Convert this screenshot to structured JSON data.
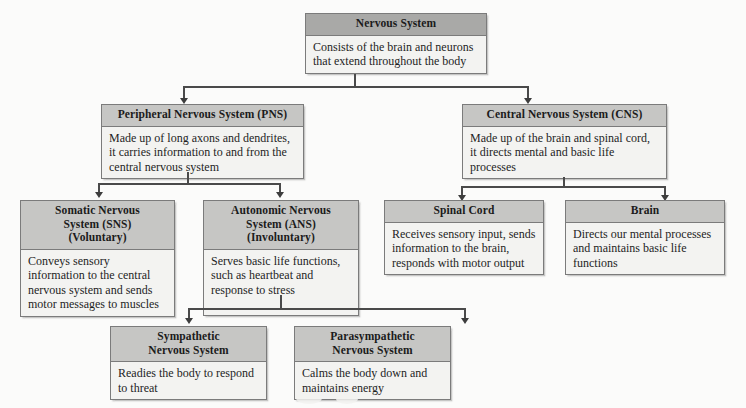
{
  "diagram": {
    "colors": {
      "root_header": "#a9a9a7",
      "node_header": "#c6c6c4",
      "node_body": "#f3f3f1",
      "border": "#7b7b7b",
      "connector": "#4a4a4a",
      "page_background": "#fbfbfa"
    },
    "nodes": [
      {
        "id": "nervous-system",
        "title": "Nervous System",
        "body": "Consists of the brain and neurons that extend throughout the body"
      },
      {
        "id": "peripheral-nervous-system",
        "title": "Peripheral Nervous System (PNS)",
        "body": "Made up of long axons and dendrites, it carries information to and from the central nervous system"
      },
      {
        "id": "central-nervous-system",
        "title": "Central Nervous System (CNS)",
        "body": "Made up of the brain and spinal cord, it directs mental and basic life processes"
      },
      {
        "id": "somatic-nervous-system",
        "title": "Somatic Nervous System (SNS) (Voluntary)",
        "title_line1": "Somatic Nervous",
        "title_line2": "System (SNS)",
        "title_line3": "(Voluntary)",
        "body": "Conveys sensory information to the central nervous system and sends motor messages to muscles"
      },
      {
        "id": "autonomic-nervous-system",
        "title": "Autonomic Nervous System (ANS) (Involuntary)",
        "title_line1": "Autonomic Nervous",
        "title_line2": "System (ANS)",
        "title_line3": "(Involuntary)",
        "body": "Serves basic life functions, such as heartbeat and response to stress"
      },
      {
        "id": "spinal-cord",
        "title": "Spinal Cord",
        "body": "Receives sensory input, sends information to the brain, responds with motor output"
      },
      {
        "id": "brain",
        "title": "Brain",
        "body": "Directs our mental processes and maintains basic life functions"
      },
      {
        "id": "sympathetic-nervous-system",
        "title": "Sympathetic Nervous System",
        "title_line1": "Sympathetic",
        "title_line2": "Nervous System",
        "body": "Readies the body to respond to threat"
      },
      {
        "id": "parasympathetic-nervous-system",
        "title": "Parasympathetic Nervous System",
        "title_line1": "Parasympathetic",
        "title_line2": "Nervous System",
        "body": "Calms the body down and maintains energy"
      }
    ]
  }
}
